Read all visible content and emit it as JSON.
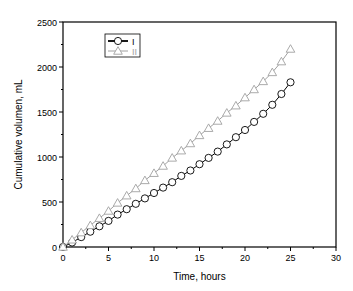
{
  "chart_data": {
    "type": "line",
    "title": "",
    "xlabel": "Time, hours",
    "ylabel": "Cumulative volumen, mL",
    "xlim": [
      0,
      30
    ],
    "ylim": [
      0,
      2500
    ],
    "x_ticks": [
      0,
      5,
      10,
      15,
      20,
      25,
      30
    ],
    "y_ticks": [
      0,
      500,
      1000,
      1500,
      2000,
      2500
    ],
    "grid": false,
    "legend_position": "upper-left",
    "x": [
      0,
      1,
      2,
      3,
      4,
      5,
      6,
      7,
      8,
      9,
      10,
      11,
      12,
      13,
      14,
      15,
      16,
      17,
      18,
      19,
      20,
      21,
      22,
      23,
      24,
      25
    ],
    "series": [
      {
        "name": "I",
        "marker": "circle",
        "color": "#000000",
        "values": [
          0,
          50,
          110,
          170,
          230,
          290,
          360,
          420,
          480,
          540,
          600,
          660,
          720,
          790,
          850,
          920,
          990,
          1060,
          1140,
          1220,
          1300,
          1390,
          1480,
          1580,
          1700,
          1830
        ]
      },
      {
        "name": "II",
        "marker": "triangle",
        "color": "#a0a0a0",
        "values": [
          0,
          80,
          160,
          240,
          320,
          400,
          490,
          570,
          650,
          740,
          820,
          900,
          990,
          1070,
          1150,
          1240,
          1320,
          1400,
          1490,
          1570,
          1660,
          1750,
          1840,
          1940,
          2060,
          2200
        ]
      }
    ]
  }
}
